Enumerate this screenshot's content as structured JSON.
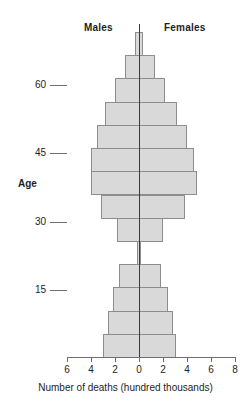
{
  "legend": {
    "males_label": "Males",
    "females_label": "Females"
  },
  "axes": {
    "y_title": "Age",
    "x_title": "Number of deaths (hundred thousands)",
    "y_ticks": [
      60,
      45,
      30,
      15
    ],
    "x_ticks": [
      6,
      4,
      2,
      0,
      2,
      4,
      6,
      8
    ]
  },
  "chart_data": {
    "type": "bar",
    "subtype": "population-pyramid",
    "title": "",
    "xlabel": "Number of deaths (hundred thousands)",
    "ylabel": "Age",
    "legend_position": "top",
    "grid": false,
    "orientation": "horizontal",
    "xlim": [
      -6,
      8
    ],
    "x_tick_values": [
      -6,
      -4,
      -2,
      0,
      2,
      4,
      6,
      8
    ],
    "x_tick_labels": [
      "6",
      "4",
      "2",
      "0",
      "2",
      "4",
      "6",
      "8"
    ],
    "ylim": [
      0,
      75
    ],
    "y_tick_values": [
      15,
      30,
      45,
      60
    ],
    "y_tick_labels": [
      "15",
      "30",
      "45",
      "60"
    ],
    "units": "hundred thousands",
    "categories": [
      "70+",
      "65-70",
      "60-65",
      "55-60",
      "50-55",
      "45-50",
      "40-45",
      "35-40",
      "30-35",
      "25-30",
      "20-25",
      "15-20",
      "10-15",
      "0-10"
    ],
    "series": [
      {
        "name": "Males",
        "direction": "left",
        "values": [
          0.3,
          1.2,
          2.0,
          2.8,
          3.5,
          4.0,
          4.0,
          3.2,
          1.8,
          0.2,
          1.7,
          2.2,
          2.6,
          3.0
        ]
      },
      {
        "name": "Females",
        "direction": "right",
        "values": [
          0.3,
          1.3,
          2.2,
          3.2,
          4.0,
          4.6,
          4.8,
          3.8,
          2.0,
          0.2,
          1.8,
          2.4,
          2.8,
          3.1
        ]
      }
    ]
  },
  "style": {
    "bar_fill": "#d9d9d9",
    "bar_stroke": "#8d8d8d",
    "axis_color": "#6e6e6e",
    "center_line_color": "#3a3a3a",
    "text_color": "#1e1e1e",
    "background": "#ffffff"
  }
}
